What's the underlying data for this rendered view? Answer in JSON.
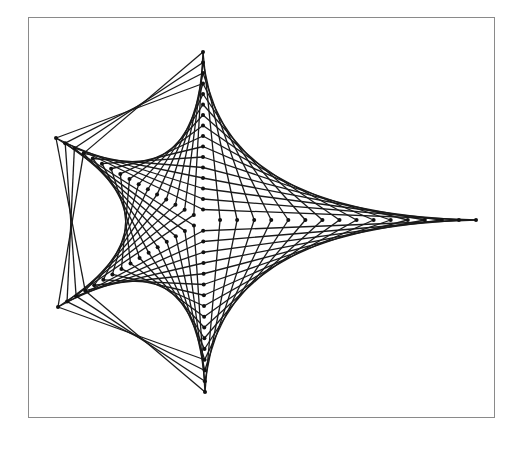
{
  "figure": {
    "type": "string-art star (curve stitching)",
    "frame": {
      "x": 28,
      "y": 17,
      "width": 467,
      "height": 401,
      "border_color": "#8a8a8a"
    },
    "line_color": "#1a1a1a",
    "dot_color": "#111111",
    "center": [
      203,
      220
    ],
    "points_per_axis": 16,
    "axes": [
      {
        "name": "right",
        "tip": [
          476,
          220
        ]
      },
      {
        "name": "top",
        "tip": [
          203,
          52
        ]
      },
      {
        "name": "upper-left",
        "tip": [
          56,
          138
        ]
      },
      {
        "name": "lower-left",
        "tip": [
          58,
          307
        ]
      },
      {
        "name": "bottom",
        "tip": [
          205,
          392
        ]
      }
    ],
    "envelope_pairs": [
      [
        "right",
        "top"
      ],
      [
        "right",
        "bottom"
      ],
      [
        "top",
        "upper-left"
      ],
      [
        "bottom",
        "lower-left"
      ],
      [
        "upper-left",
        "lower-left"
      ]
    ],
    "crossed_outer_pairs": [
      {
        "a": "upper-left",
        "b": "top",
        "count": 4
      },
      {
        "a": "lower-left",
        "b": "bottom",
        "count": 4
      },
      {
        "a": "upper-left",
        "b": "lower-left",
        "count": 4
      }
    ]
  }
}
